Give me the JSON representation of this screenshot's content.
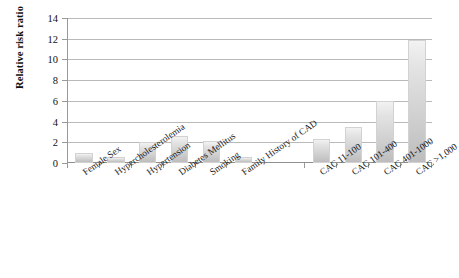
{
  "chart_data": {
    "type": "bar",
    "title": "",
    "xlabel": "",
    "ylabel": "Relative risk ratio",
    "ylim": [
      0,
      14
    ],
    "ytick_values": [
      0,
      2,
      4,
      6,
      8,
      10,
      12,
      14
    ],
    "ytick_labels": [
      "0",
      "2",
      "4",
      "6",
      "8",
      "10",
      "12",
      "14"
    ],
    "grid": true,
    "legend": "none",
    "groups": [
      {
        "name": "Traditional risk factors",
        "categories": [
          "Female Sex",
          "Hypercholesterolemia",
          "Hypertension",
          "Diabetes Mellitus",
          "Smoking",
          "Family History of CAD"
        ],
        "values": [
          1.0,
          0.6,
          2.0,
          2.6,
          2.1,
          0.6
        ]
      },
      {
        "name": "Coronary artery calcium score",
        "categories": [
          "CAC 11-100",
          "CAC 101-400",
          "CAC 401-1000",
          "CAC >1,000"
        ],
        "values": [
          2.3,
          3.5,
          6.0,
          11.9
        ]
      }
    ],
    "categories": [
      "Female Sex",
      "Hypercholesterolemia",
      "Hypertension",
      "Diabetes Mellitus",
      "Smoking",
      "Family History of CAD",
      "CAC 11-100",
      "CAC 101-400",
      "CAC 401-1000",
      "CAC >1,000"
    ],
    "values": [
      1.0,
      0.6,
      2.0,
      2.6,
      2.1,
      0.6,
      2.3,
      3.5,
      6.0,
      11.9
    ],
    "bar_color": "#cfcfcf",
    "grid_color": "#b9b9b9",
    "axis_color": "#9a9a9a",
    "text_color": "#111111"
  }
}
